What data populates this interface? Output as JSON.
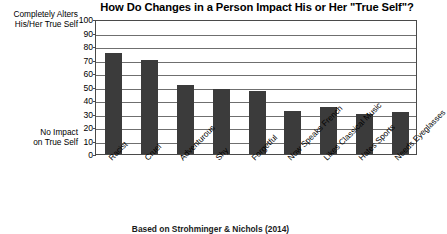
{
  "chart_data": {
    "type": "bar",
    "title": "How Do Changes in a Person Impact His or Her \"True Self\"?",
    "xlabel": "",
    "ylabel": "",
    "ylim": [
      0,
      100
    ],
    "yticks": [
      0,
      10,
      20,
      30,
      40,
      50,
      60,
      70,
      80,
      90,
      100
    ],
    "grid": true,
    "legend": null,
    "categories": [
      "Racist",
      "Cruel",
      "Adventurous",
      "Shy",
      "Forgetful",
      "Now Speaks French",
      "Likes Classical Music",
      "Hates Sports",
      "Needs Eyeglasses"
    ],
    "values": [
      75,
      70,
      51,
      48,
      47,
      32,
      35,
      30,
      31
    ],
    "annotations": {
      "axis_top_line1": "Completely Alters",
      "axis_top_line2": "His/Her True Self",
      "axis_bottom_line1": "No Impact",
      "axis_bottom_line2": "on True Self"
    },
    "source_note": "Based on Strohminger & Nichols (2014)",
    "bar_color": "#3b3b3b",
    "grid_color": "#6f6f6f",
    "axis_color": "#4a4a4a"
  }
}
